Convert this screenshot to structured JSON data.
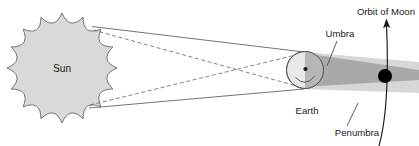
{
  "diagram": {
    "type": "astronomy-schematic",
    "canvas": {
      "width": 419,
      "height": 146
    },
    "colors": {
      "background": "#ffffff",
      "sun_fill": "#d9d9d9",
      "sun_stroke": "#6e6e6e",
      "earth_fill_light": "#e6e6e6",
      "earth_fill_shadow": "#b3b3b3",
      "earth_stroke": "#5a5a5a",
      "umbra": "#a8a8a8",
      "penumbra": "#d4d4d4",
      "moon_fill": "#000000",
      "ray_solid": "#5a5a5a",
      "ray_dashed": "#6b6b6b",
      "label_text": "#1a1a1a",
      "leader_line": "#4d4d4d",
      "orbit_stroke": "#1a1a1a"
    },
    "labels": {
      "sun": "Sun",
      "earth": "Earth",
      "umbra": "Umbra",
      "penumbra": "Penumbra",
      "orbit_of_moon": "Orbit of Moon"
    },
    "bodies": [
      {
        "name": "sun",
        "label": "Sun",
        "shape": "starburst",
        "cx": 62,
        "cy": 68,
        "outer_radius": 55,
        "inner_radius": 44,
        "points": 16
      },
      {
        "name": "earth",
        "label": "Earth",
        "shape": "circle",
        "cx": 305,
        "cy": 70,
        "radius": 19
      },
      {
        "name": "moon",
        "label": "Orbit of Moon",
        "shape": "circle-filled",
        "cx": 385,
        "cy": 76,
        "radius": 7
      }
    ],
    "shadow_regions": [
      {
        "name": "umbra",
        "label": "Umbra",
        "tone": "dark",
        "description": "Dark inner cone converging to the right of Earth"
      },
      {
        "name": "penumbra",
        "label": "Penumbra",
        "tone": "light",
        "description": "Lighter outer shadow band surrounding the umbra"
      }
    ],
    "rays": {
      "solid_count": 2,
      "dashed_count": 2,
      "solid_description": "Outer tangent lines from Sun's limbs defining the penumbra",
      "dashed_description": "Crossing tangent lines from Sun's limbs defining the umbra"
    },
    "orbit": {
      "name": "moon-orbit-arc",
      "label": "Orbit of Moon",
      "direction": "counter-clockwise",
      "arrow_at": "top"
    }
  }
}
